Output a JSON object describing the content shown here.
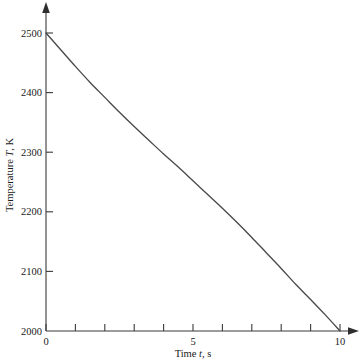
{
  "chart_data": {
    "type": "line",
    "title": "",
    "subtitle": "",
    "xlabel_full": "Time t, s",
    "xlabel_prefix": "Time ",
    "xlabel_symbol": "t",
    "xlabel_suffix": ", s",
    "ylabel_full": "Temperature T, K",
    "ylabel_prefix": "Temperature ",
    "ylabel_symbol": "T",
    "ylabel_suffix": ", K",
    "xlim": [
      0,
      10
    ],
    "ylim": [
      2000,
      2500
    ],
    "grid": false,
    "legend": null,
    "x_major_ticks": [
      0,
      5,
      10
    ],
    "x_major_tick_labels": [
      "0",
      "5",
      "10"
    ],
    "x_minor_ticks": [
      0,
      1,
      2,
      3,
      4,
      5,
      6,
      7,
      8,
      9,
      10
    ],
    "y_major_ticks": [
      2000,
      2100,
      2200,
      2300,
      2400,
      2500
    ],
    "y_major_tick_labels": [
      "2000",
      "2100",
      "2200",
      "2300",
      "2400",
      "2500"
    ],
    "x": [
      0,
      0.5,
      1,
      1.5,
      2,
      2.5,
      3,
      3.5,
      4,
      4.5,
      5,
      5.5,
      6,
      6.5,
      7,
      7.5,
      8,
      8.5,
      9,
      9.5,
      10
    ],
    "values": [
      2500,
      2472,
      2444,
      2417,
      2392,
      2367,
      2343,
      2320,
      2297,
      2275,
      2252,
      2229,
      2206,
      2182,
      2157,
      2131,
      2105,
      2078,
      2053,
      2027,
      2000
    ],
    "series": [
      {
        "name": "Temperature",
        "color": "#4a4a4a",
        "values": [
          2500,
          2472,
          2444,
          2417,
          2392,
          2367,
          2343,
          2320,
          2297,
          2275,
          2252,
          2229,
          2206,
          2182,
          2157,
          2131,
          2105,
          2078,
          2053,
          2027,
          2000
        ]
      }
    ],
    "annotations": []
  },
  "axes": {
    "x_tick_labels": [
      "0",
      "5",
      "10"
    ],
    "y_tick_labels": [
      "2500",
      "2400",
      "2300",
      "2200",
      "2100",
      "2000"
    ],
    "x_axis_name": "time-axis",
    "y_axis_name": "temperature-axis"
  },
  "colors": {
    "curve": "#4a4a4a",
    "axis": "#3a3a3a",
    "text": "#1a1a1a",
    "background": "#ffffff"
  }
}
